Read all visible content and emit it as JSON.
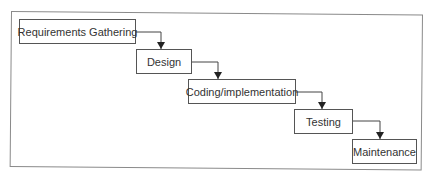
{
  "diagram": {
    "type": "waterfall-flowchart",
    "steps": [
      {
        "label": "Requirements Gathering"
      },
      {
        "label": "Design"
      },
      {
        "label": "Coding/implementation"
      },
      {
        "label": "Testing"
      },
      {
        "label": "Maintenance"
      }
    ],
    "connections": [
      {
        "from": "Requirements Gathering",
        "to": "Design"
      },
      {
        "from": "Design",
        "to": "Coding/implementation"
      },
      {
        "from": "Coding/implementation",
        "to": "Testing"
      },
      {
        "from": "Testing",
        "to": "Maintenance"
      }
    ],
    "colors": {
      "stroke": "#555555",
      "frame": "#8a8a8a",
      "text": "#333333",
      "background": "#ffffff"
    }
  }
}
